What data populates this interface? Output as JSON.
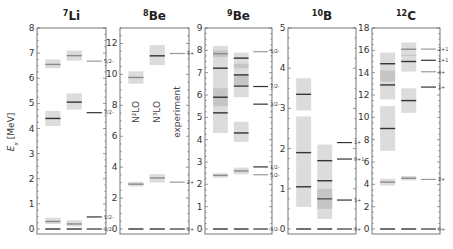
{
  "chart_data": {
    "type": "level-scheme",
    "ylabel": "E_x [MeV]",
    "column_labels": [
      "N²LO",
      "N³LO",
      "experiment"
    ],
    "panels": [
      {
        "nucleus": "Li",
        "mass": "7",
        "ylim": [
          0,
          8
        ],
        "yticks": [
          0,
          1,
          2,
          3,
          4,
          5,
          6,
          7,
          8
        ],
        "theory_N2LO": [
          {
            "E": 0.0,
            "lo": 0.0,
            "hi": 0.0
          },
          {
            "E": 0.3,
            "lo": 0.2,
            "hi": 0.45
          },
          {
            "E": 4.4,
            "lo": 4.1,
            "hi": 4.7
          },
          {
            "E": 6.55,
            "lo": 6.4,
            "hi": 6.75
          }
        ],
        "theory_N3LO": [
          {
            "E": 0.0,
            "lo": 0.0,
            "hi": 0.0
          },
          {
            "E": 0.2,
            "lo": 0.1,
            "hi": 0.35
          },
          {
            "E": 5.05,
            "lo": 4.75,
            "hi": 5.4
          },
          {
            "E": 6.9,
            "lo": 6.7,
            "hi": 7.1
          }
        ],
        "experiment": [
          {
            "E": 0.0,
            "label": "3/2-"
          },
          {
            "E": 0.48,
            "label": "1/2-"
          },
          {
            "E": 4.63,
            "label": "7/2-"
          },
          {
            "E": 6.68,
            "label": "5/2-"
          }
        ]
      },
      {
        "nucleus": "Be",
        "mass": "8",
        "ylim": [
          0,
          13
        ],
        "yticks": [
          0,
          2,
          4,
          6,
          8,
          10,
          12
        ],
        "theory_N2LO": [
          {
            "E": 0.0,
            "lo": 0.0,
            "hi": 0.0
          },
          {
            "E": 2.9,
            "lo": 2.75,
            "hi": 3.05
          },
          {
            "E": 9.8,
            "lo": 9.4,
            "hi": 10.2
          }
        ],
        "theory_N3LO": [
          {
            "E": 0.0,
            "lo": 0.0,
            "hi": 0.0
          },
          {
            "E": 3.3,
            "lo": 3.0,
            "hi": 3.55
          },
          {
            "E": 11.2,
            "lo": 10.6,
            "hi": 11.9
          }
        ],
        "experiment": [
          {
            "E": 0.0,
            "label": "0+"
          },
          {
            "E": 3.03,
            "label": "2+"
          },
          {
            "E": 11.35,
            "label": "4+"
          }
        ]
      },
      {
        "nucleus": "Be",
        "mass": "9",
        "ylim": [
          0,
          9
        ],
        "yticks": [
          0,
          1,
          2,
          3,
          4,
          5,
          6,
          7,
          8,
          9
        ],
        "theory_N2LO": [
          {
            "E": 0.0,
            "lo": 0.0,
            "hi": 0.0
          },
          {
            "E": 2.4,
            "lo": 2.3,
            "hi": 2.5
          },
          {
            "E": 5.2,
            "lo": 4.3,
            "hi": 6.2
          },
          {
            "E": 5.9,
            "lo": 5.5,
            "hi": 6.3
          },
          {
            "E": 7.2,
            "lo": 6.2,
            "hi": 8.2
          },
          {
            "E": 7.85,
            "lo": 7.7,
            "hi": 8.0
          }
        ],
        "theory_N3LO": [
          {
            "E": 0.0,
            "lo": 0.0,
            "hi": 0.0
          },
          {
            "E": 2.6,
            "lo": 2.45,
            "hi": 2.75
          },
          {
            "E": 4.3,
            "lo": 3.9,
            "hi": 4.8
          },
          {
            "E": 6.4,
            "lo": 5.9,
            "hi": 6.9
          },
          {
            "E": 6.9,
            "lo": 6.4,
            "hi": 7.4
          },
          {
            "E": 7.65,
            "lo": 7.2,
            "hi": 7.9
          }
        ],
        "experiment": [
          {
            "E": 0.0,
            "label": "3/2-"
          },
          {
            "E": 2.43,
            "label": "5/2-"
          },
          {
            "E": 2.78,
            "label": "1/2-"
          },
          {
            "E": 5.59,
            "label": "3/2-"
          },
          {
            "E": 6.38,
            "label": "7/2-"
          },
          {
            "E": 7.94,
            "label": "5/2-"
          }
        ]
      },
      {
        "nucleus": "B",
        "mass": "10",
        "ylim": [
          0,
          5
        ],
        "yticks": [
          0,
          1,
          2,
          3,
          4,
          5
        ],
        "theory_N2LO": [
          {
            "E": 0.0,
            "lo": 0.0,
            "hi": 0.0
          },
          {
            "E": 1.05,
            "lo": 0.55,
            "hi": 1.55
          },
          {
            "E": 1.9,
            "lo": 1.55,
            "hi": 2.8
          },
          {
            "E": 3.35,
            "lo": 2.95,
            "hi": 3.75
          }
        ],
        "theory_N3LO": [
          {
            "E": 0.0,
            "lo": 0.0,
            "hi": 0.0
          },
          {
            "E": 0.75,
            "lo": 0.25,
            "hi": 1.0
          },
          {
            "E": 1.2,
            "lo": 0.5,
            "hi": 1.4
          },
          {
            "E": 1.7,
            "lo": 1.4,
            "hi": 2.1
          }
        ],
        "experiment": [
          {
            "E": 0.0,
            "label": "3+"
          },
          {
            "E": 0.72,
            "label": "1+"
          },
          {
            "E": 1.74,
            "label": "0+1"
          },
          {
            "E": 2.15,
            "label": "1+"
          }
        ]
      },
      {
        "nucleus": "C",
        "mass": "12",
        "ylim": [
          0,
          18
        ],
        "yticks": [
          0,
          2,
          4,
          6,
          8,
          10,
          12,
          14,
          16,
          18
        ],
        "theory_N2LO": [
          {
            "E": 0.0,
            "lo": 0.0,
            "hi": 0.0
          },
          {
            "E": 4.2,
            "lo": 3.9,
            "hi": 4.5
          },
          {
            "E": 9.0,
            "lo": 7.0,
            "hi": 11.0
          },
          {
            "E": 12.9,
            "lo": 11.6,
            "hi": 14.2
          },
          {
            "E": 14.8,
            "lo": 13.2,
            "hi": 15.8
          }
        ],
        "theory_N3LO": [
          {
            "E": 0.0,
            "lo": 0.0,
            "hi": 0.0
          },
          {
            "E": 4.55,
            "lo": 4.35,
            "hi": 4.75
          },
          {
            "E": 11.5,
            "lo": 10.4,
            "hi": 12.6
          },
          {
            "E": 15.0,
            "lo": 14.1,
            "hi": 15.6
          },
          {
            "E": 16.1,
            "lo": 15.5,
            "hi": 16.7
          }
        ],
        "experiment": [
          {
            "E": 0.0,
            "label": "0+"
          },
          {
            "E": 4.44,
            "label": "2+"
          },
          {
            "E": 12.71,
            "label": "1+"
          },
          {
            "E": 14.08,
            "label": "4+"
          },
          {
            "E": 15.11,
            "label": "1+1"
          },
          {
            "E": 16.11,
            "label": "2+1"
          }
        ]
      }
    ]
  }
}
